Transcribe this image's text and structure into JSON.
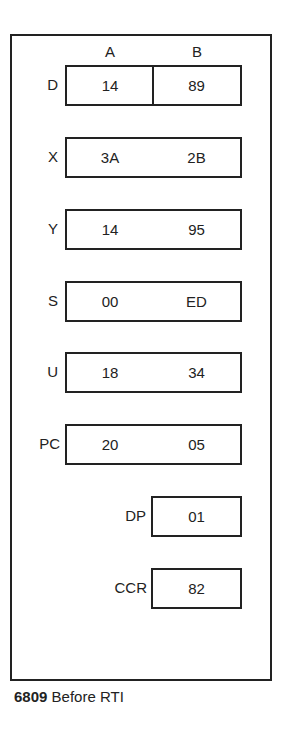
{
  "figure": {
    "title": "6809 Before RTI",
    "caption_number": "6809",
    "caption_text": "Before RTI",
    "column_headers": [
      "A",
      "B"
    ]
  },
  "registers": [
    {
      "name": "D",
      "high": "14",
      "low": "89",
      "split": true
    },
    {
      "name": "X",
      "high": "3A",
      "low": "2B",
      "split": false
    },
    {
      "name": "Y",
      "high": "14",
      "low": "95",
      "split": false
    },
    {
      "name": "S",
      "high": "00",
      "low": "ED",
      "split": false
    },
    {
      "name": "U",
      "high": "18",
      "low": "34",
      "split": false
    },
    {
      "name": "PC",
      "high": "20",
      "low": "05",
      "split": false
    },
    {
      "name": "DP",
      "value": "01"
    },
    {
      "name": "CCR",
      "value": "82"
    }
  ],
  "colors": {
    "line": "#222222",
    "text": "#222222",
    "background": "#ffffff"
  }
}
